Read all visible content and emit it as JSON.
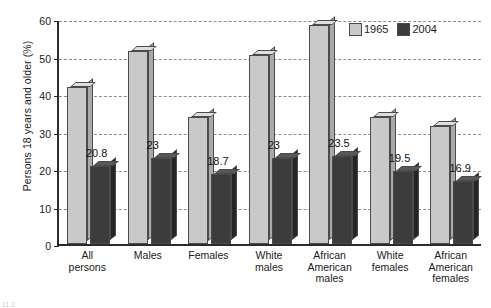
{
  "chart_data": {
    "type": "bar",
    "title": "",
    "xlabel": "",
    "ylabel": "Persons 18 years and older (%)",
    "ylim": [
      0,
      60
    ],
    "yticks": [
      0,
      10,
      20,
      30,
      40,
      50,
      60
    ],
    "grid": true,
    "legend_position": "top-right",
    "categories": [
      "All persons",
      "Males",
      "Females",
      "White males",
      "African American males",
      "White females",
      "African American females"
    ],
    "category_lines": [
      [
        "All",
        "persons"
      ],
      [
        "Males"
      ],
      [
        "Females"
      ],
      [
        "White",
        "males"
      ],
      [
        "African",
        "American",
        "males"
      ],
      [
        "White",
        "females"
      ],
      [
        "African",
        "American",
        "females"
      ]
    ],
    "series": [
      {
        "name": "1965",
        "color": "#c9c9c9",
        "values": [
          42,
          51.5,
          34,
          50.5,
          58.5,
          34,
          31.5
        ],
        "labels": [
          "",
          "",
          "",
          "",
          "",
          "",
          ""
        ]
      },
      {
        "name": "2004",
        "color": "#3c3c3c",
        "values": [
          20.8,
          23,
          18.7,
          23,
          23.5,
          19.5,
          16.9
        ],
        "labels": [
          "20.8",
          "23",
          "18.7",
          "23",
          "23.5",
          "19.5",
          "16.9"
        ]
      }
    ]
  },
  "legend": {
    "items": [
      {
        "label": "1965",
        "color": "#c9c9c9"
      },
      {
        "label": "2004",
        "color": "#3c3c3c"
      }
    ]
  },
  "caption": {
    "text": "11.2"
  }
}
